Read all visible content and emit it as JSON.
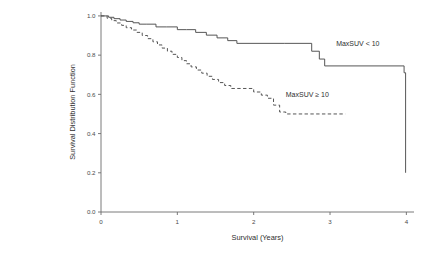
{
  "chart_data": {
    "type": "line",
    "title": "",
    "subtitle": "",
    "xlabel": "Survival (Years)",
    "ylabel": "Survival Distribution Function",
    "xlim": [
      0,
      4.1
    ],
    "ylim": [
      0,
      1.02
    ],
    "xticks": [
      0,
      1,
      2,
      3,
      4
    ],
    "xticklabels": [
      "0",
      "1",
      "2",
      "3",
      "4"
    ],
    "yticks": [
      0.0,
      0.2,
      0.4,
      0.6,
      0.8,
      1.0
    ],
    "yticklabels": [
      "0.0",
      "0.2",
      "0.4",
      "0.6",
      "0.8",
      "1.0"
    ],
    "grid": false,
    "legend_position": "inline-annotation",
    "step_style": "post",
    "series": [
      {
        "name": "MaxSUV < 10",
        "style": "solid",
        "color": "#4d4d4d",
        "annotation": "MaxSUV < 10",
        "annotation_x": 3.08,
        "annotation_y": 0.845,
        "x": [
          0.0,
          0.1,
          0.17,
          0.25,
          0.33,
          0.42,
          0.5,
          0.6,
          0.72,
          0.86,
          1.0,
          1.12,
          1.24,
          1.38,
          1.52,
          1.66,
          1.78,
          2.4,
          2.76,
          2.86,
          2.93,
          3.97,
          3.99
        ],
        "y": [
          1.0,
          0.993,
          0.986,
          0.979,
          0.972,
          0.965,
          0.958,
          0.958,
          0.944,
          0.944,
          0.93,
          0.93,
          0.916,
          0.902,
          0.888,
          0.874,
          0.86,
          0.86,
          0.82,
          0.78,
          0.745,
          0.71,
          0.2
        ]
      },
      {
        "name": "MaxSUV ≥ 10",
        "style": "dashed",
        "color": "#4d4d4d",
        "annotation": "MaxSUV ≥ 10",
        "annotation_x": 2.42,
        "annotation_y": 0.585,
        "x": [
          0.0,
          0.08,
          0.14,
          0.2,
          0.27,
          0.33,
          0.4,
          0.47,
          0.54,
          0.61,
          0.68,
          0.74,
          0.8,
          0.87,
          0.93,
          1.0,
          1.06,
          1.12,
          1.18,
          1.25,
          1.32,
          1.39,
          1.46,
          1.54,
          1.62,
          1.7,
          1.86,
          2.0,
          2.1,
          2.18,
          2.26,
          2.34,
          2.42,
          3.2
        ],
        "y": [
          1.0,
          0.988,
          0.976,
          0.964,
          0.952,
          0.94,
          0.928,
          0.916,
          0.9,
          0.884,
          0.868,
          0.852,
          0.836,
          0.82,
          0.804,
          0.788,
          0.772,
          0.756,
          0.74,
          0.724,
          0.708,
          0.692,
          0.676,
          0.66,
          0.645,
          0.63,
          0.63,
          0.612,
          0.596,
          0.58,
          0.545,
          0.51,
          0.5,
          0.5
        ]
      }
    ]
  }
}
